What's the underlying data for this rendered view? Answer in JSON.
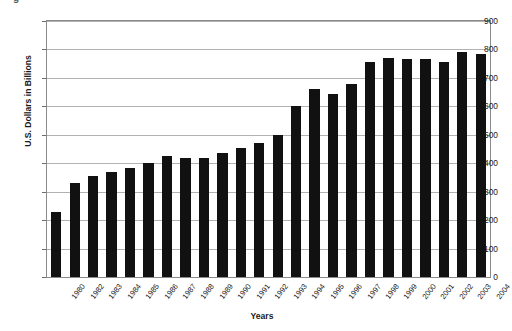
{
  "figure": {
    "caption_fragment": "g"
  },
  "chart_data": {
    "type": "bar",
    "title": "",
    "xlabel": "Years",
    "ylabel": "U.S. Dollars in Billions",
    "ylim": [
      0,
      900
    ],
    "ytick_step": 100,
    "yticks": [
      0,
      100,
      200,
      300,
      400,
      500,
      600,
      700,
      800,
      900
    ],
    "ytick_labels": [
      "0",
      "100",
      "200",
      "300",
      "400",
      "500",
      "600",
      "700",
      "800",
      "900"
    ],
    "grid": true,
    "grid_axis": "y",
    "legend": false,
    "bar_color": "#111111",
    "background_color": "#ffffff",
    "plot_border_color": "#8a8a8a",
    "gridline_color": "#b2b2b2",
    "categories": [
      "1980",
      "1982",
      "1983",
      "1984",
      "1985",
      "1986",
      "1987",
      "1988",
      "1989",
      "1990",
      "1991",
      "1992",
      "1993",
      "1994",
      "1995",
      "1996",
      "1997",
      "1998",
      "1999",
      "2000",
      "2001",
      "2002",
      "2003",
      "2004"
    ],
    "values": [
      230,
      330,
      355,
      370,
      385,
      400,
      425,
      420,
      420,
      437,
      452,
      472,
      500,
      600,
      660,
      645,
      678,
      757,
      770,
      765,
      765,
      755,
      790,
      783
    ]
  }
}
